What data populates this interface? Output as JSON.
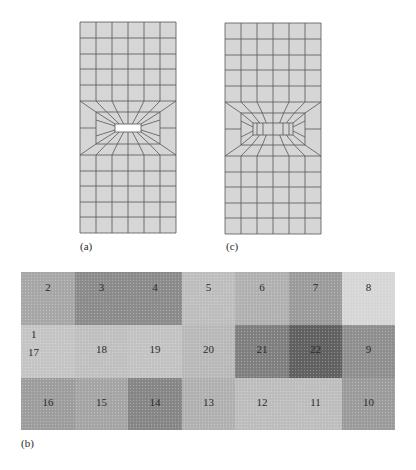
{
  "panels": {
    "a": {
      "label": "(a)",
      "description": "finite element mesh with central rectangular hole",
      "columns": 6,
      "has_hole": true
    },
    "c": {
      "label": "(c)",
      "description": "finite element mesh with filled central region",
      "columns": 6,
      "has_hole": false
    },
    "b": {
      "label": "(b)",
      "description": "22 numbered zones in 3 rows",
      "zones": [
        {
          "id": "2",
          "shade": "#a6a6a6"
        },
        {
          "id": "3",
          "shade": "#8a8a8a"
        },
        {
          "id": "4",
          "shade": "#8a8a8a"
        },
        {
          "id": "5",
          "shade": "#bdbdbd"
        },
        {
          "id": "6",
          "shade": "#b0b0b0"
        },
        {
          "id": "7",
          "shade": "#9a9a9a"
        },
        {
          "id": "8",
          "shade": "#d6d6d6"
        },
        {
          "id": "1",
          "shade": "#c4c4c4"
        },
        {
          "id": "17",
          "shade": "#c4c4c4"
        },
        {
          "id": "18",
          "shade": "#bfbfbf"
        },
        {
          "id": "19",
          "shade": "#c2c2c2"
        },
        {
          "id": "20",
          "shade": "#b8b8b8"
        },
        {
          "id": "21",
          "shade": "#7e7e7e"
        },
        {
          "id": "22",
          "shade": "#5f5f5f"
        },
        {
          "id": "9",
          "shade": "#8e8e8e"
        },
        {
          "id": "16",
          "shade": "#9c9c9c"
        },
        {
          "id": "15",
          "shade": "#a4a4a4"
        },
        {
          "id": "14",
          "shade": "#858585"
        },
        {
          "id": "13",
          "shade": "#b0b0b0"
        },
        {
          "id": "12",
          "shade": "#bcbcbc"
        },
        {
          "id": "11",
          "shade": "#bdbdbd"
        },
        {
          "id": "10",
          "shade": "#9a9a9a"
        }
      ]
    }
  },
  "colors": {
    "mesh_fill": "#d6d6d6",
    "mesh_line": "#555555",
    "hole": "#ffffff"
  }
}
